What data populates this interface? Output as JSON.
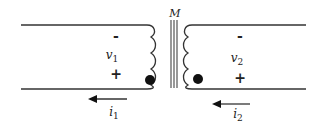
{
  "diagram": {
    "type": "coupled-inductors",
    "mutual_label": "M",
    "left": {
      "minus": "-",
      "voltage": "v",
      "voltage_sub": "1",
      "plus": "+",
      "current": "i",
      "current_sub": "1"
    },
    "right": {
      "minus": "-",
      "voltage": "v",
      "voltage_sub": "2",
      "plus": "+",
      "current": "i",
      "current_sub": "2"
    },
    "colors": {
      "line": "#333333",
      "background": "#ffffff"
    }
  }
}
